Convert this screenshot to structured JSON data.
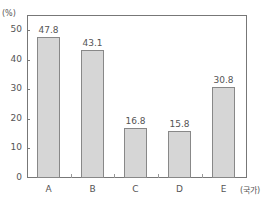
{
  "chart_data": {
    "type": "bar",
    "title": "",
    "categories": [
      "A",
      "B",
      "C",
      "D",
      "E"
    ],
    "values": [
      47.8,
      43.1,
      16.8,
      15.8,
      30.8
    ],
    "value_labels": [
      "47.8",
      "43.1",
      "16.8",
      "15.8",
      "30.8"
    ],
    "xlabel": "(국가)",
    "ylabel": "(%)",
    "ylim": [
      0,
      50
    ],
    "yticks": [
      0,
      10,
      20,
      30,
      40,
      50
    ],
    "ytick_labels": [
      "0",
      "10",
      "20",
      "30",
      "40",
      "50"
    ],
    "grid": false,
    "legend": null,
    "bar_color": "#d6d6d6",
    "bar_edge_color": "#888888"
  }
}
